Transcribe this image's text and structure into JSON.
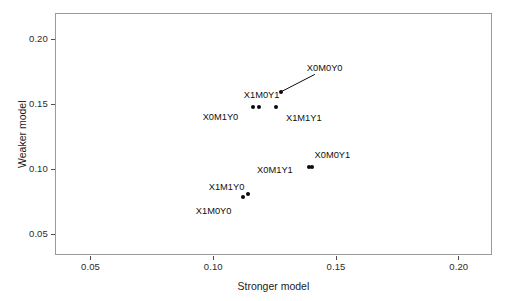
{
  "chart_data": {
    "type": "scatter",
    "title": "",
    "xlabel": "Stronger model",
    "ylabel": "Weaker model",
    "xlim": [
      0.0355,
      0.2135
    ],
    "ylim": [
      0.0345,
      0.2205
    ],
    "xticks": [
      0.05,
      0.1,
      0.15,
      0.2
    ],
    "xticklabels": [
      "0.05",
      "0.10",
      "0.15",
      "0.20"
    ],
    "yticks": [
      0.05,
      0.1,
      0.15,
      0.2
    ],
    "yticklabels": [
      "0.05",
      "0.10",
      "0.15",
      "0.20"
    ],
    "grid": false,
    "legend": null,
    "points": [
      {
        "label": "X0M0Y0",
        "x": 0.1275,
        "y": 0.1595,
        "label_dx": 26,
        "label_dy": -29,
        "leader": true
      },
      {
        "label": "X1M0Y1",
        "x": 0.1185,
        "y": 0.1485,
        "label_dx": -15,
        "label_dy": -17,
        "leader": false
      },
      {
        "label": "X0M1Y0",
        "x": 0.116,
        "y": 0.148,
        "label_dx": -50,
        "label_dy": 5,
        "leader": false
      },
      {
        "label": "X1M1Y1",
        "x": 0.1255,
        "y": 0.148,
        "label_dx": 10,
        "label_dy": 6,
        "leader": false
      },
      {
        "label": "X0M0Y1",
        "x": 0.14,
        "y": 0.1025,
        "label_dx": 3,
        "label_dy": -17,
        "leader": false
      },
      {
        "label": "X0M1Y1",
        "x": 0.139,
        "y": 0.102,
        "label_dx": -52,
        "label_dy": -2,
        "leader": false
      },
      {
        "label": "X1M1Y0",
        "x": 0.114,
        "y": 0.0815,
        "label_dx": -39,
        "label_dy": -12,
        "leader": false
      },
      {
        "label": "X1M0Y0",
        "x": 0.112,
        "y": 0.079,
        "label_dx": -47,
        "label_dy": 9,
        "leader": false
      }
    ]
  }
}
